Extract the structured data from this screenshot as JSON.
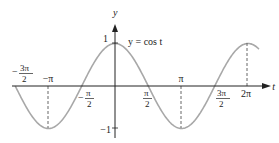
{
  "chart_data": {
    "type": "line",
    "title": "",
    "function_label": "y = cos t",
    "xlabel": "t",
    "ylabel": "y",
    "x_ticks": [
      {
        "value": -4.712,
        "label_num": "3π",
        "label_den": "2",
        "sign": "−"
      },
      {
        "value": -3.1416,
        "label": "−π"
      },
      {
        "value": -1.5708,
        "label_num": "π",
        "label_den": "2",
        "sign": "−"
      },
      {
        "value": 1.5708,
        "label_num": "π",
        "label_den": "2",
        "sign": ""
      },
      {
        "value": 3.1416,
        "label": "π"
      },
      {
        "value": 4.712,
        "label_num": "3π",
        "label_den": "2",
        "sign": ""
      },
      {
        "value": 6.2832,
        "label": "2π"
      }
    ],
    "y_ticks": [
      {
        "value": 1,
        "label": "1"
      },
      {
        "value": -1,
        "label": "−1"
      }
    ],
    "xlim": [
      -4.712,
      6.8
    ],
    "ylim": [
      -1.1,
      1.2
    ],
    "series": [
      {
        "name": "y = cos t",
        "x": [
          -4.712,
          -3.927,
          -3.1416,
          -2.356,
          -1.5708,
          -0.785,
          0,
          0.785,
          1.5708,
          2.356,
          3.1416,
          3.927,
          4.712,
          5.498,
          6.2832,
          6.8
        ],
        "y": [
          0,
          -0.707,
          -1,
          -0.707,
          0,
          0.707,
          1,
          0.707,
          0,
          -0.707,
          -1,
          -0.707,
          0,
          0.707,
          1,
          0.87
        ]
      }
    ],
    "dashed_guides": [
      -3.1416,
      3.1416,
      6.2832
    ],
    "grid": false,
    "legend": null
  },
  "labels": {
    "y_axis": "y",
    "t_axis": "t",
    "func": "y = cos t",
    "one": "1",
    "neg_one": "−1",
    "neg_pi": "−π",
    "pi": "π",
    "two_pi": "2π",
    "pi_sym": "π",
    "three_pi": "3π",
    "two": "2",
    "minus": "−"
  },
  "colors": {
    "curve": "#a8a8a8",
    "axis": "#222222"
  }
}
